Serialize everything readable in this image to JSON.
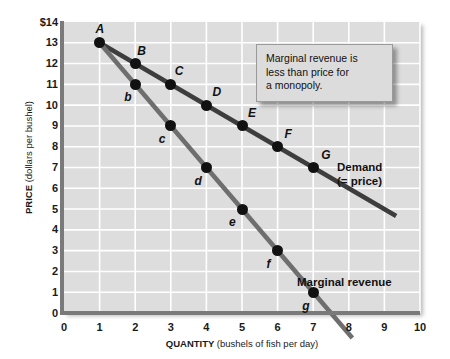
{
  "chart_data": {
    "type": "line",
    "title": "",
    "xlabel_bold": "QUANTITY",
    "xlabel_unit": "(bushels of fish per day)",
    "ylabel_bold": "PRICE",
    "ylabel_unit": "(dollars per bushel)",
    "xlim": [
      0,
      10
    ],
    "ylim": [
      0,
      14
    ],
    "grid": true,
    "x_ticks": [
      "0",
      "1",
      "2",
      "3",
      "4",
      "5",
      "6",
      "7",
      "8",
      "9",
      "10"
    ],
    "y_ticks": [
      "$14",
      "13",
      "12",
      "11",
      "10",
      "9",
      "8",
      "7",
      "6",
      "5",
      "4",
      "3",
      "2",
      "1",
      "0"
    ],
    "legend_position": "inline-annotation",
    "series": [
      {
        "name": "Demand (= price)",
        "label_line1": "Demand",
        "label_line2": "(= price)",
        "color": "#3d3d3d",
        "line_x": [
          1,
          9.33
        ],
        "line_y": [
          13,
          4.67
        ],
        "points": [
          {
            "label": "A",
            "x": 1,
            "y": 13
          },
          {
            "label": "B",
            "x": 2,
            "y": 12
          },
          {
            "label": "C",
            "x": 3,
            "y": 11
          },
          {
            "label": "D",
            "x": 4,
            "y": 10
          },
          {
            "label": "E",
            "x": 5,
            "y": 9
          },
          {
            "label": "F",
            "x": 6,
            "y": 8
          },
          {
            "label": "G",
            "x": 7,
            "y": 7
          }
        ]
      },
      {
        "name": "Marginal revenue",
        "label_line1": "Marginal revenue",
        "color": "#6e6e6e",
        "line_x": [
          1,
          8.1
        ],
        "line_y": [
          13,
          -1.2
        ],
        "points": [
          {
            "label": "b",
            "x": 2,
            "y": 11
          },
          {
            "label": "c",
            "x": 3,
            "y": 9
          },
          {
            "label": "d",
            "x": 4,
            "y": 7
          },
          {
            "label": "e",
            "x": 5,
            "y": 5
          },
          {
            "label": "f",
            "x": 6,
            "y": 3
          },
          {
            "label": "g",
            "x": 7,
            "y": 1
          }
        ]
      }
    ],
    "annotation": {
      "line1": "Marginal revenue is",
      "line2": "less than price for",
      "line3": "a monopoly."
    },
    "colors": {
      "plot_background": "#dddddd",
      "gridline": "#ffffff",
      "axis": "#7a7a7a",
      "demand_line": "#3d3d3d",
      "marginal_revenue_line": "#6e6e6e",
      "point_marker": "#111111",
      "callout_background": "#dcdcdc"
    }
  }
}
